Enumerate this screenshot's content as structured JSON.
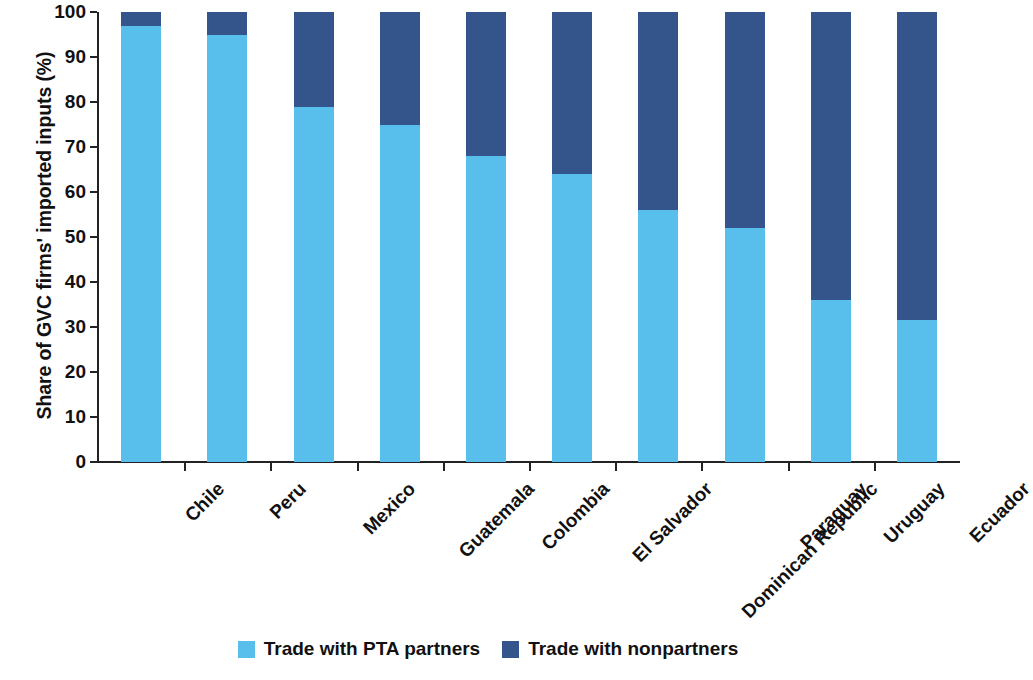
{
  "chart_data": {
    "type": "bar",
    "stacked": true,
    "stacked_mode": "percent",
    "title": "",
    "subtitle": "",
    "xlabel": "",
    "ylabel": "Share of GVC firms' imported inputs (%)",
    "ylim": [
      0,
      100
    ],
    "yticks": [
      0,
      10,
      20,
      30,
      40,
      50,
      60,
      70,
      80,
      90,
      100
    ],
    "ytick_labels": [
      "0",
      "10",
      "20",
      "30",
      "40",
      "50",
      "60",
      "70",
      "80",
      "90",
      "100"
    ],
    "grid": false,
    "legend_position": "bottom-center",
    "categories": [
      "Chile",
      "Peru",
      "Mexico",
      "Guatemala",
      "Colombia",
      "El Salvador",
      "Dominican Republic",
      "Paraguay",
      "Uruguay",
      "Ecuador"
    ],
    "series": [
      {
        "name": "Trade with PTA partners",
        "color": "#58BFED",
        "values": [
          97,
          95,
          79,
          75,
          68,
          64,
          56,
          52,
          36,
          31.5
        ]
      },
      {
        "name": "Trade with nonpartners",
        "color": "#33558C",
        "values": [
          3,
          5,
          21,
          25,
          32,
          36,
          44,
          48,
          64,
          68.5
        ]
      }
    ]
  },
  "legend": {
    "items": [
      {
        "label": "Trade with PTA partners",
        "color": "#58BFED"
      },
      {
        "label": "Trade with nonpartners",
        "color": "#33558C"
      }
    ]
  },
  "axes": {
    "y_title": "Share of GVC firms' imported inputs (%)",
    "axis_color": "#222222"
  }
}
